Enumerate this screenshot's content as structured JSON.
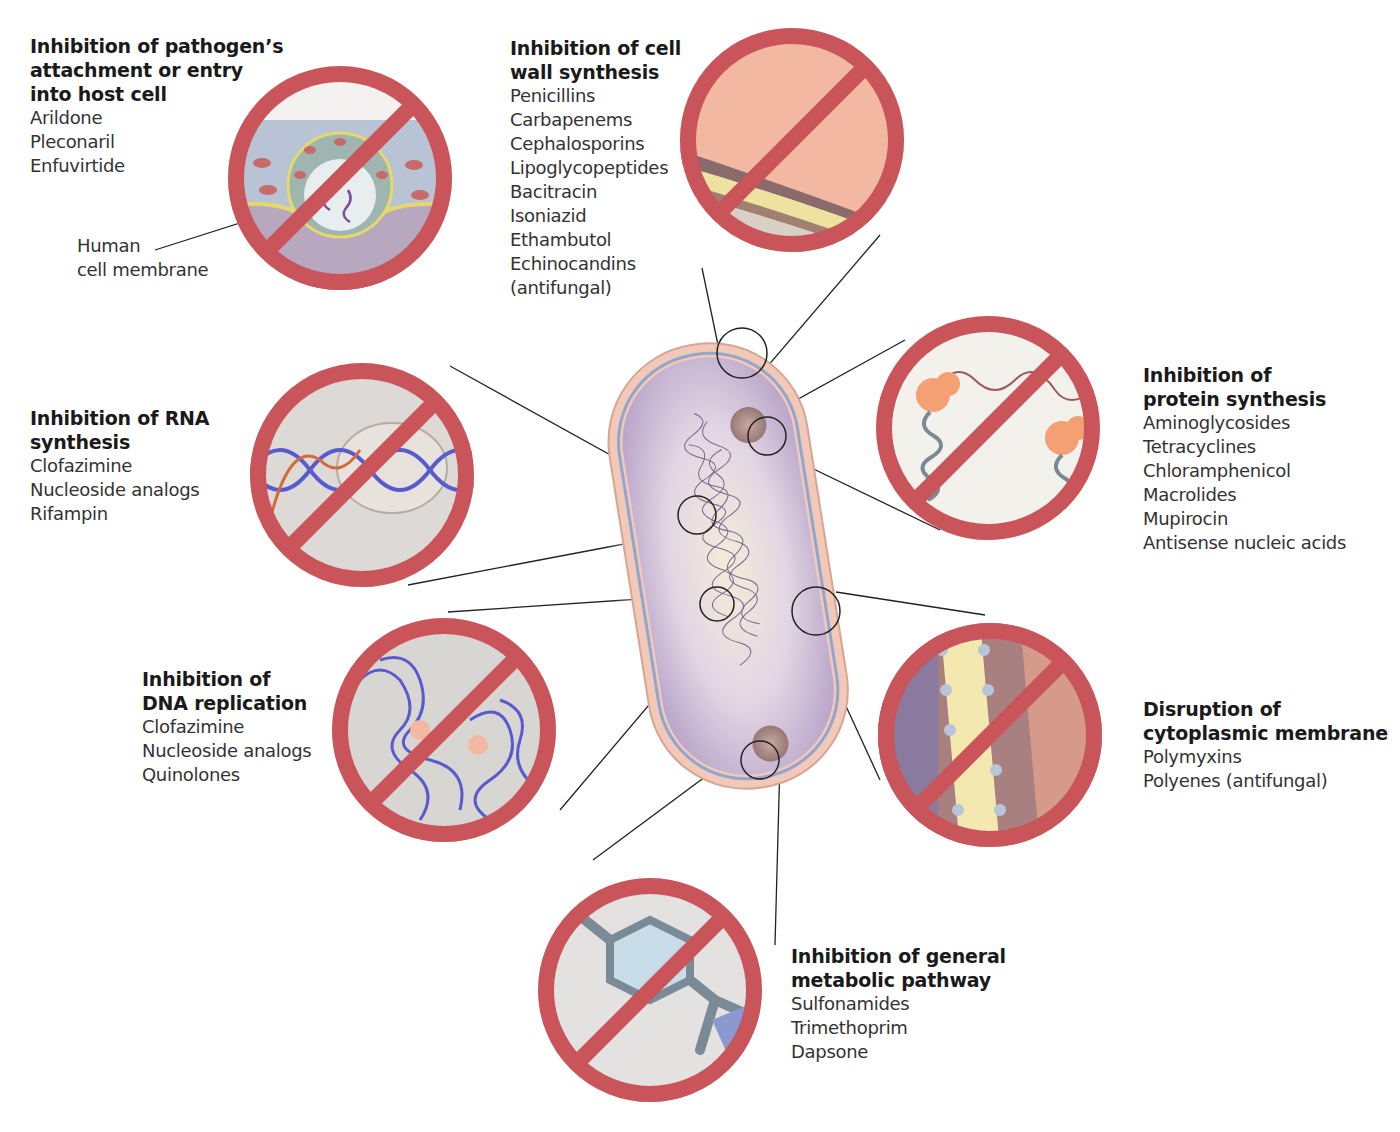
{
  "diagram": {
    "center": "Bacterial cell",
    "mechanisms": [
      {
        "id": "attachment",
        "title": "Inhibition of pathogen’s\nattachment or entry\ninto host cell",
        "drugs": [
          "Arildone",
          "Pleconaril",
          "Enfuvirtide"
        ],
        "callout": "Human\ncell membrane"
      },
      {
        "id": "cell-wall",
        "title": "Inhibition of cell\nwall synthesis",
        "drugs": [
          "Penicillins",
          "Carbapenems",
          "Cephalosporins",
          "Lipoglycopeptides",
          "Bacitracin",
          "Isoniazid",
          "Ethambutol",
          "Echinocandins",
          "(antifungal)"
        ]
      },
      {
        "id": "protein",
        "title": "Inhibition of\nprotein synthesis",
        "drugs": [
          "Aminoglycosides",
          "Tetracyclines",
          "Chloramphenicol",
          "Macrolides",
          "Mupirocin",
          "Antisense nucleic acids"
        ]
      },
      {
        "id": "rna",
        "title": "Inhibition of RNA\nsynthesis",
        "drugs": [
          "Clofazimine",
          "Nucleoside analogs",
          "Rifampin"
        ]
      },
      {
        "id": "dna",
        "title": "Inhibition of\nDNA replication",
        "drugs": [
          "Clofazimine",
          "Nucleoside analogs",
          "Quinolones"
        ]
      },
      {
        "id": "membrane",
        "title": "Disruption of\ncytoplasmic membrane",
        "drugs": [
          "Polymyxins",
          "Polyenes (antifungal)"
        ]
      },
      {
        "id": "metabolic",
        "title": "Inhibition of general\nmetabolic pathway",
        "drugs": [
          "Sulfonamides",
          "Trimethoprim",
          "Dapsone"
        ]
      }
    ],
    "colors": {
      "prohibition_red": "#c9555a",
      "cell_outer": "#f2c9b8",
      "cell_membrane": "#8fa6cf",
      "cytoplasm": "#c9b8d6",
      "nucleoid": "#6b4f80"
    }
  }
}
